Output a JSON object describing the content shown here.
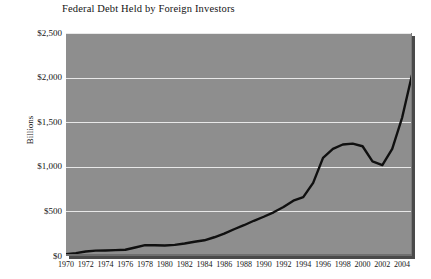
{
  "chart_data": {
    "type": "line",
    "title": "Federal Debt Held by Foreign Investors",
    "xlabel": "",
    "ylabel": "Billions",
    "xlim": [
      1970,
      2005
    ],
    "ylim": [
      0,
      2500
    ],
    "grid": true,
    "legend": null,
    "y_ticks": [
      {
        "value": 0,
        "label": "$0"
      },
      {
        "value": 500,
        "label": "$500"
      },
      {
        "value": 1000,
        "label": "$1,000"
      },
      {
        "value": 1500,
        "label": "$1,500"
      },
      {
        "value": 2000,
        "label": "$2,000"
      },
      {
        "value": 2500,
        "label": "$2,500"
      }
    ],
    "x_ticks": [
      {
        "value": 1970,
        "label": "1970"
      },
      {
        "value": 1972,
        "label": "1972"
      },
      {
        "value": 1974,
        "label": "1974"
      },
      {
        "value": 1976,
        "label": "1976"
      },
      {
        "value": 1978,
        "label": "1978"
      },
      {
        "value": 1980,
        "label": "1980"
      },
      {
        "value": 1982,
        "label": "1982"
      },
      {
        "value": 1984,
        "label": "1984"
      },
      {
        "value": 1986,
        "label": "1986"
      },
      {
        "value": 1988,
        "label": "1988"
      },
      {
        "value": 1990,
        "label": "1990"
      },
      {
        "value": 1992,
        "label": "1992"
      },
      {
        "value": 1994,
        "label": "1994"
      },
      {
        "value": 1996,
        "label": "1996"
      },
      {
        "value": 1998,
        "label": "1998"
      },
      {
        "value": 2000,
        "label": "2000"
      },
      {
        "value": 2002,
        "label": "2002"
      },
      {
        "value": 2004,
        "label": "2004"
      }
    ],
    "x": [
      1970,
      1971,
      1972,
      1973,
      1974,
      1975,
      1976,
      1977,
      1978,
      1979,
      1980,
      1981,
      1982,
      1983,
      1984,
      1985,
      1986,
      1987,
      1988,
      1989,
      1990,
      1991,
      1992,
      1993,
      1994,
      1995,
      1996,
      1997,
      1998,
      1999,
      2000,
      2001,
      2002,
      2003,
      2004,
      2005
    ],
    "values": [
      20,
      32,
      50,
      60,
      62,
      66,
      70,
      95,
      122,
      120,
      118,
      125,
      140,
      160,
      176,
      210,
      250,
      300,
      345,
      395,
      440,
      490,
      550,
      620,
      660,
      820,
      1100,
      1200,
      1250,
      1260,
      1230,
      1060,
      1020,
      1200,
      1550,
      2030
    ],
    "colors": {
      "plot_background": "#8e8e8e",
      "gridline": "#e8e8e8",
      "line": "#101010",
      "page_background": "#ffffff",
      "text": "#141414"
    }
  }
}
